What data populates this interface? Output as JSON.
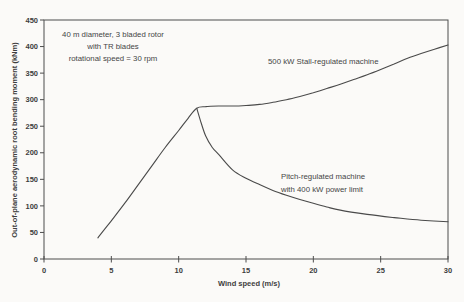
{
  "chart_data": {
    "type": "line",
    "title": "",
    "xlabel": "Wind speed (m/s)",
    "ylabel": "Out-of-plane aerodynamic root bending moment (kNm)",
    "xlim": [
      0,
      30
    ],
    "ylim": [
      0,
      450
    ],
    "xticks": [
      0,
      5,
      10,
      15,
      20,
      25,
      30
    ],
    "yticks": [
      0,
      50,
      100,
      150,
      200,
      250,
      300,
      350,
      400,
      450
    ],
    "grid": false,
    "legend_position": "none",
    "line_color": "#4a4a4a",
    "axis_color": "#4d4d4d",
    "annotations": [
      {
        "id": "rotor-note",
        "line1": "40 m diameter, 3 bladed rotor",
        "line2": "with TR blades",
        "line3": "rotational speed = 30 rpm"
      },
      {
        "id": "stall-label",
        "line1": "500 kW Stall-regulated machine"
      },
      {
        "id": "pitch-label",
        "line1": "Pitch-regulated machine",
        "line2": "with 400 kW power limit"
      }
    ],
    "series": [
      {
        "name": "500 kW Stall-regulated machine",
        "x": [
          4,
          5,
          6,
          7,
          8,
          9,
          10,
          10.7,
          11.34,
          12,
          13,
          14,
          15,
          16,
          17,
          18,
          19,
          20,
          21,
          22,
          23,
          24,
          25,
          26,
          27,
          28,
          29,
          30
        ],
        "y": [
          40,
          72,
          105,
          140,
          175,
          210,
          242,
          265,
          284,
          287,
          288,
          288,
          289,
          291,
          295,
          300,
          306,
          313,
          321,
          329,
          338,
          347,
          357,
          367,
          378,
          387,
          395,
          403
        ]
      },
      {
        "name": "Pitch-regulated machine with 400 kW power limit",
        "x": [
          11.34,
          11.6,
          12,
          12.5,
          13,
          14,
          15,
          16,
          17,
          18,
          19,
          20,
          21,
          22,
          24,
          26,
          28,
          30
        ],
        "y": [
          284,
          262,
          232,
          210,
          196,
          168,
          152,
          140,
          129,
          120,
          112,
          105,
          98,
          92,
          84,
          78,
          73,
          70
        ]
      }
    ]
  }
}
